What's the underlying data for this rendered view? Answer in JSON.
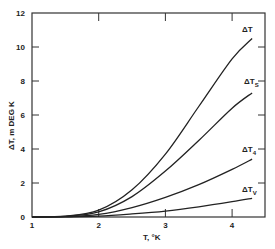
{
  "chart_data": {
    "type": "line",
    "title": "",
    "xlabel": "T, °K",
    "ylabel": "ΔT, m DEG K",
    "xlim": [
      1,
      4.5
    ],
    "ylim": [
      0,
      12
    ],
    "x_ticks": [
      "1",
      "2",
      "3",
      "4"
    ],
    "y_ticks": [
      "0",
      "2",
      "4",
      "6",
      "8",
      "10",
      "12"
    ],
    "grid": false,
    "legend": "inline labels at curve ends",
    "x": [
      1.0,
      1.5,
      2.0,
      2.5,
      3.0,
      3.5,
      4.0,
      4.3
    ],
    "series": [
      {
        "name": "ΔT",
        "label_main": "ΔT",
        "label_sub": "",
        "values": [
          0.0,
          0.05,
          0.4,
          1.6,
          3.7,
          6.5,
          9.3,
          10.5
        ]
      },
      {
        "name": "ΔTs",
        "label_main": "ΔT",
        "label_sub": "S",
        "values": [
          0.0,
          0.04,
          0.3,
          1.2,
          2.7,
          4.5,
          6.4,
          7.3
        ]
      },
      {
        "name": "ΔT4",
        "label_main": "ΔT",
        "label_sub": "4",
        "values": [
          0.0,
          0.02,
          0.15,
          0.55,
          1.15,
          1.9,
          2.8,
          3.4
        ]
      },
      {
        "name": "ΔTv",
        "label_main": "ΔT",
        "label_sub": "V",
        "values": [
          0.0,
          0.01,
          0.05,
          0.18,
          0.35,
          0.6,
          0.9,
          1.1
        ]
      }
    ]
  },
  "labels": {
    "xlabel": "T, °K",
    "ylabel": "ΔT,  m DEG K"
  }
}
